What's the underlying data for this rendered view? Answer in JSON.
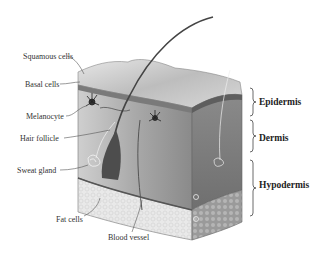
{
  "diagram": {
    "left_labels": [
      {
        "text": "Squamous cells"
      },
      {
        "text": "Basal cells"
      },
      {
        "text": "Melanocyte"
      },
      {
        "text": "Hair follicle"
      },
      {
        "text": "Sweat gland"
      },
      {
        "text": "Fat cells"
      }
    ],
    "bottom_label": {
      "text": "Blood vessel"
    },
    "layers": [
      {
        "text": "Epidermis"
      },
      {
        "text": "Dermis"
      },
      {
        "text": "Hypodermis"
      }
    ],
    "colors": {
      "surface": "#cfcfcf",
      "dermis": "#8f8f8f",
      "hypodermis": "#e4e4e4",
      "label_text": "#333333"
    }
  }
}
